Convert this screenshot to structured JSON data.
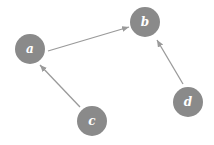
{
  "diagram": {
    "type": "directed-graph",
    "colors": {
      "node_fill": "#8a8a8a",
      "edge": "#9a9a9a",
      "label": "#ffffff",
      "background": "#ffffff"
    },
    "nodes": [
      {
        "id": "a",
        "label": "a",
        "x": 30,
        "y": 49,
        "r": 15
      },
      {
        "id": "b",
        "label": "b",
        "x": 145,
        "y": 22,
        "r": 15
      },
      {
        "id": "c",
        "label": "c",
        "x": 92,
        "y": 121,
        "r": 15
      },
      {
        "id": "d",
        "label": "d",
        "x": 188,
        "y": 102,
        "r": 15
      }
    ],
    "edges": [
      {
        "from": "a",
        "to": "b"
      },
      {
        "from": "c",
        "to": "a"
      },
      {
        "from": "d",
        "to": "b"
      }
    ]
  }
}
